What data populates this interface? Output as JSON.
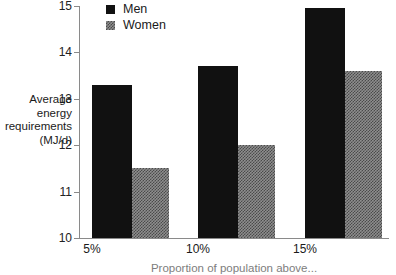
{
  "chart_data": {
    "type": "bar",
    "title": "",
    "categories": [
      "5%",
      "10%",
      "15%"
    ],
    "series": [
      {
        "name": "Men",
        "values": [
          13.3,
          13.7,
          14.95
        ],
        "color": "#111111",
        "fill": "solid"
      },
      {
        "name": "Women",
        "values": [
          11.5,
          12.0,
          13.6
        ],
        "color": "#8e8e8e",
        "fill": "checkered"
      }
    ],
    "xlabel": "Proportion of population above...",
    "ylabel": "Average energy requirements (MJ/d)",
    "ylim": [
      10,
      15
    ],
    "yticks": [
      10,
      11,
      12,
      13,
      14,
      15
    ],
    "ytick_labels": [
      "10",
      "11",
      "12",
      "13",
      "14",
      "15"
    ],
    "grid": false,
    "legend_position": "top-left-inside"
  },
  "legend": {
    "items": [
      {
        "label": "Men"
      },
      {
        "label": "Women"
      }
    ]
  },
  "axes": {
    "y_title_lines": [
      "Average",
      "energy",
      "requirements",
      "(MJ/d)"
    ],
    "x_title": "Proportion of population above...",
    "y_tick_labels": [
      "15",
      "14",
      "13",
      "12",
      "11",
      "10"
    ],
    "x_tick_labels": [
      "5%",
      "10%",
      "15%"
    ]
  }
}
